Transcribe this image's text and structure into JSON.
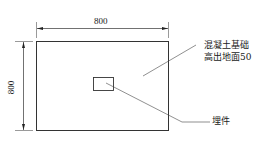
{
  "diagram": {
    "dimensions": {
      "width_label": "800",
      "height_label": "800"
    },
    "callouts": {
      "concrete_foundation_line1": "混凝土基础",
      "concrete_foundation_line2": "高出地面50",
      "embedded_part": "埋件"
    },
    "colors": {
      "line": "#333333",
      "text": "#1a1a1a",
      "background": "#ffffff"
    }
  }
}
